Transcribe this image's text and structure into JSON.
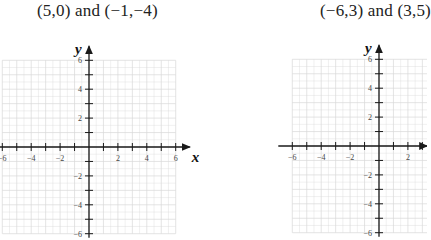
{
  "problems": [
    {
      "title": "(5,0) and (−1,−4)",
      "points": [
        [
          5,
          0
        ],
        [
          -1,
          -4
        ]
      ],
      "x_axis_label": "x",
      "y_axis_label": "y",
      "x_tick_labels": [
        "−6",
        "−4",
        "−2",
        "2",
        "4",
        "6"
      ],
      "y_tick_labels": [
        "6",
        "4",
        "2",
        "−2",
        "−4",
        "−6"
      ]
    },
    {
      "title": "(−6,3) and (3,5)",
      "points": [
        [
          -6,
          3
        ],
        [
          3,
          5
        ]
      ],
      "x_axis_label": "x",
      "y_axis_label": "y",
      "x_tick_labels": [
        "−6",
        "−4",
        "−2",
        "2"
      ],
      "y_tick_labels": [
        "6",
        "4",
        "2",
        "−2",
        "−4",
        "−6"
      ]
    }
  ],
  "colors": {
    "grid": "#d8d8d8",
    "axis": "#1a1a1a",
    "text": "#222222"
  }
}
